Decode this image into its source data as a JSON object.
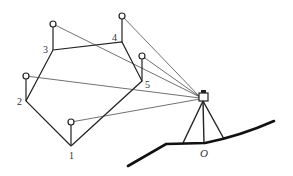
{
  "diagram": {
    "type": "survey-traverse-with-total-station",
    "station_label": "O",
    "points": [
      {
        "label": "1",
        "vertex": [
          71,
          146
        ],
        "prism": [
          71,
          122
        ],
        "label_pos": [
          69,
          159
        ]
      },
      {
        "label": "2",
        "vertex": [
          26,
          101
        ],
        "prism": [
          26,
          76
        ],
        "label_pos": [
          17,
          105
        ]
      },
      {
        "label": "3",
        "vertex": [
          53,
          50
        ],
        "prism": [
          53,
          24
        ],
        "label_pos": [
          43,
          53
        ]
      },
      {
        "label": "4",
        "vertex": [
          122,
          42
        ],
        "prism": [
          122,
          16
        ],
        "label_pos": [
          112,
          41
        ]
      },
      {
        "label": "5",
        "vertex": [
          142,
          81
        ],
        "prism": [
          142,
          56
        ],
        "label_pos": [
          145,
          88
        ]
      }
    ],
    "polygon_order": [
      "1",
      "2",
      "3",
      "4",
      "5"
    ],
    "instrument": [
      203,
      98
    ],
    "colors": {
      "line": "#222222",
      "ground": "#111111"
    }
  }
}
